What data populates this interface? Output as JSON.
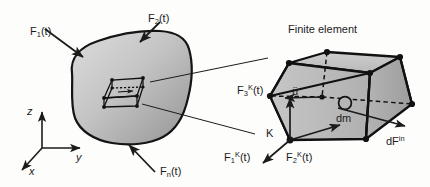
{
  "figure": {
    "caption": "Finite element",
    "background_color": "#fdfdfc",
    "ink_color": "#1b1b1b",
    "body_fill_light": "#d6d6d6",
    "body_fill_dark": "#9a9a9a",
    "element_fill": "#bdbdbd",
    "element_fill_dark": "#a3a3a3"
  },
  "axes": {
    "z": "z",
    "y": "y",
    "x": "x"
  },
  "external_forces": [
    {
      "id": "F1",
      "base": "F",
      "sub": "1",
      "arg": "(t)",
      "text": "F1(t)"
    },
    {
      "id": "F2",
      "base": "F",
      "sub": "2",
      "arg": "(t)",
      "text": "F2(t)"
    },
    {
      "id": "Fn",
      "base": "F",
      "sub": "n",
      "arg": "(t)",
      "text": "Fn(t)"
    }
  ],
  "nodal_forces": [
    {
      "id": "F1K",
      "base": "F",
      "sub": "1",
      "sup": "K",
      "arg": "(t)",
      "text": "F1^K(t)"
    },
    {
      "id": "F2K",
      "base": "F",
      "sub": "2",
      "sup": "K",
      "arg": "(t)",
      "text": "F2^K(t)"
    },
    {
      "id": "F3K",
      "base": "F",
      "sub": "3",
      "sup": "K",
      "arg": "(t)",
      "text": "F3^K(t)"
    }
  ],
  "element_labels": {
    "node": "K",
    "acceleration": "ü",
    "mass_element": "dm",
    "inertial_force_base": "dF",
    "inertial_force_sup": "in",
    "inertial_force_text": "dF^in"
  }
}
